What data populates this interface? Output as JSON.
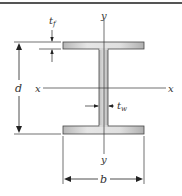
{
  "diagram": {
    "type": "wide-flange I-beam cross section",
    "labels": {
      "flange_thickness": "t",
      "flange_thickness_sub": "f",
      "web_thickness": "t",
      "web_thickness_sub": "w",
      "depth": "d",
      "flange_width": "b",
      "x_axis_left": "x",
      "x_axis_right": "x",
      "y_axis_top": "y",
      "y_axis_bottom": "y"
    },
    "colors": {
      "border": "#555555",
      "section_fill": "#d4d4d4",
      "section_stroke": "#444444",
      "lines": "#333333"
    }
  }
}
